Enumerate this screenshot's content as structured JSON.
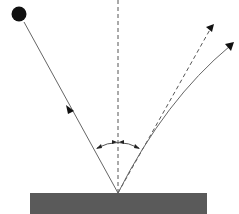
{
  "diagram": {
    "colors": {
      "line": "#555555",
      "surface": "#5a5a5a",
      "ball": "#111111",
      "background": "#ffffff"
    },
    "elements": {
      "ball": "ball",
      "incident_ray": "incident path",
      "normal_line": "normal",
      "ideal_reflection": "ideal reflected path (dashed)",
      "actual_reflection": "actual curved path",
      "angle_arc": "angle markers",
      "surface": "surface"
    }
  }
}
